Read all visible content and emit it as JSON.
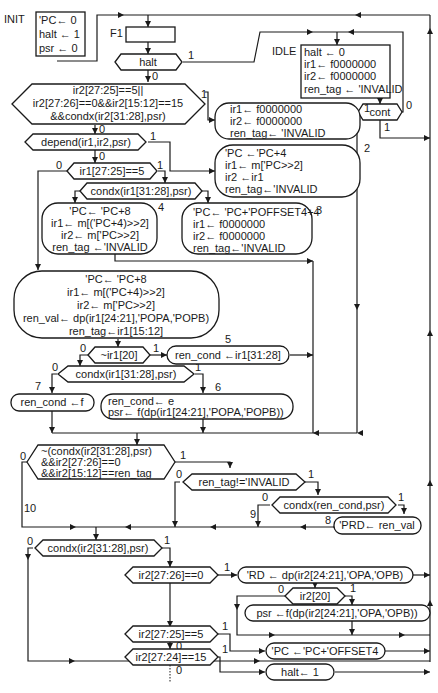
{
  "diagram": {
    "type": "state-machine-flowchart",
    "states": {
      "init": {
        "label": "INIT",
        "lines": [
          "'PC← 0",
          "halt ← 1",
          "psr ← 0"
        ]
      },
      "f1": {
        "label": "F1"
      },
      "idle": {
        "label": "IDLE",
        "lines": [
          "halt ← 0",
          "ir1← f0000000",
          "ir2← f0000000",
          "ren_tag ← 'INVALID"
        ]
      }
    },
    "decisions": {
      "halt": {
        "text": "halt",
        "yes": "1",
        "no": "0"
      },
      "cont": {
        "text": "cont",
        "yes": "1",
        "no": "0"
      },
      "hazard": {
        "lines": [
          "ir2[27:25]==5||",
          "ir2[27:26]==0&&ir2[15:12]==15",
          "&&condx(ir2[31:28],psr)"
        ],
        "yes": "1",
        "no": "0"
      },
      "depend": {
        "text": "depend(ir1,ir2,psr)",
        "yes": "1",
        "no": "0"
      },
      "ir1_branch": {
        "text": "ir1[27:25]==5",
        "yes": "1",
        "no": "0"
      },
      "condx_ir1_a": {
        "text": "condx(ir1[31:28],psr)"
      },
      "not_ir1_20": {
        "text": "~ir1[20]",
        "yes": "1",
        "no": "0"
      },
      "condx_ir1_b": {
        "text": "condx(ir1[31:28],psr)",
        "yes": "1",
        "no": "0"
      },
      "squash": {
        "lines": [
          "~(condx(ir2[31:28],psr)",
          "&&ir2[27:26]==0",
          "&&ir2[15:12]==ren_tag"
        ],
        "yes": "1",
        "no": "0"
      },
      "ren_tag_valid": {
        "text": "ren_tag!='INVALID",
        "yes": "1",
        "no": "0"
      },
      "condx_ren": {
        "text": "condx(ren_cond,psr)",
        "yes": "1",
        "no": "0"
      },
      "condx_ir2": {
        "text": "condx(ir2[31:28],psr)",
        "yes": "1",
        "no": "0"
      },
      "ir2_alu": {
        "text": "ir2[27:26]==0",
        "yes": "1",
        "no": "0"
      },
      "ir2_20": {
        "text": "ir2[20]",
        "yes": "1",
        "no": "0"
      },
      "ir2_branch": {
        "text": "ir2[27:25]==5",
        "yes": "1",
        "no": "0"
      },
      "ir2_halt": {
        "text": "ir2[27:24]==15",
        "yes": "1",
        "no": "0"
      }
    },
    "actions": {
      "a1": {
        "num": "1",
        "lines": [
          "ir1← f0000000",
          "ir2← f0000000",
          "ren_tag←  'INVALID"
        ]
      },
      "a2": {
        "num": "2",
        "lines": [
          "'PC ←'PC+4",
          "ir1← m['PC>>2]",
          "ir2 ←ir1",
          "ren_tag←'INVALID"
        ]
      },
      "a3": {
        "num": "3",
        "lines": [
          "'PC← 'PC+'POFFSET4+4",
          "ir1← f0000000",
          "ir2← f0000000",
          "ren_tag←'INVALID"
        ]
      },
      "a4": {
        "num": "4",
        "lines": [
          "'PC← 'PC+8",
          "ir1← m[('PC+4)>>2]",
          "ir2← m['PC>>2]",
          "ren_tag ←'INVALID"
        ]
      },
      "big": {
        "lines": [
          "'PC← 'PC+8",
          "ir1← m[('PC+4)>>2]",
          "ir2← m['PC>>2]",
          "ren_val← dp(ir1[24:21],'POPA,'POPB)",
          "ren_tag←ir1[15:12]"
        ]
      },
      "a5": {
        "num": "5",
        "lines": [
          "ren_cond ←ir1[31:28]"
        ]
      },
      "a6": {
        "num": "6",
        "lines": [
          "ren_cond← e",
          "psr← f(dp(ir1[24:21],'POPA,'POPB))"
        ]
      },
      "a7": {
        "num": "7",
        "lines": [
          "ren_cond ←f"
        ]
      },
      "a8": {
        "num": "8",
        "lines": [
          "'PRD← ren_val"
        ]
      },
      "a9": {
        "num": "9"
      },
      "a10": {
        "num": "10"
      },
      "rd": {
        "lines": [
          "'RD ← dp(ir2[24:21],'OPA,'OPB)"
        ]
      },
      "psr": {
        "lines": [
          "psr ←f(dp(ir2[24:21],'OPA,'OPB))"
        ]
      },
      "pc_off": {
        "lines": [
          "'PC ←'PC+'OFFSET4"
        ]
      },
      "halt_set": {
        "lines": [
          "halt← 1"
        ]
      }
    }
  }
}
